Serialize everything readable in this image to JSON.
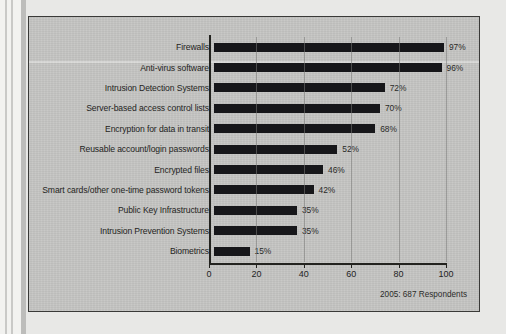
{
  "figure": {
    "footnote": "2005: 687 Respondents",
    "background_color": "#c6c6c4",
    "bar_color": "#17171a",
    "frame_color": "#3a3a38"
  },
  "chart_data": {
    "type": "bar",
    "orientation": "horizontal",
    "title": "",
    "xlabel": "",
    "ylabel": "",
    "xlim": [
      0,
      100
    ],
    "xticks": [
      0,
      20,
      40,
      60,
      80,
      100
    ],
    "xtick_labels": [
      "0",
      "20",
      "40",
      "60",
      "80",
      "100"
    ],
    "grid": true,
    "legend": "none",
    "value_suffix": "%",
    "categories": [
      "Firewalls",
      "Anti-virus software",
      "Intrusion Detection Systems",
      "Server-based access control lists",
      "Encryption for data in transit",
      "Reusable account/login passwords",
      "Encrypted files",
      "Smart cards/other one-time password tokens",
      "Public Key Infrastructure",
      "Intrusion Prevention Systems",
      "Biometrics"
    ],
    "values": [
      97,
      96,
      72,
      70,
      68,
      52,
      46,
      42,
      35,
      35,
      15
    ],
    "value_labels": [
      "97%",
      "96%",
      "72%",
      "70%",
      "68%",
      "52%",
      "46%",
      "42%",
      "35%",
      "35%",
      "15%"
    ],
    "annotation": "2005: 687 Respondents"
  }
}
